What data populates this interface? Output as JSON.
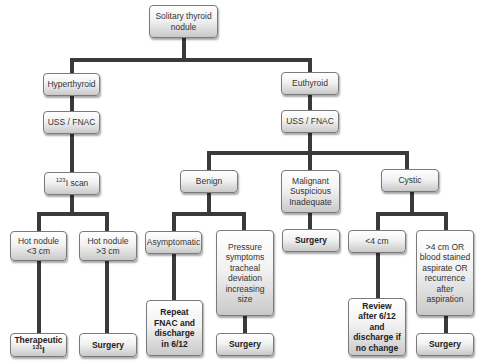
{
  "diagram": {
    "colors": {
      "connector": "#3a3a3a",
      "box_border": "#7a7a7a",
      "box_fill_top": "#ffffff",
      "box_fill_bottom": "#c9c9c9",
      "text": "#333333"
    },
    "nodes": {
      "root": "Solitary thyroid nodule",
      "hyperthyroid": "Hyperthyroid",
      "hyper_uss": "USS / FNAC",
      "iscan_sup": "123",
      "iscan": "I scan",
      "hot_small": "Hot nodule <3 cm",
      "hot_large": "Hot nodule >3 cm",
      "therapeutic": "Therapeutic ",
      "therapeutic_sup": "131",
      "therapeutic_suffix": "I",
      "surgery_hot": "Surgery",
      "euthyroid": "Euthyroid",
      "eu_uss": "USS / FNAC",
      "benign": "Benign",
      "malignant": "Malignant Suspicious Inadequate",
      "cystic": "Cystic",
      "asymptomatic": "Asymptomatic",
      "pressure": "Pressure symptoms tracheal deviation increasing size",
      "repeat_fnac": "Repeat FNAC and discharge in 6/12",
      "surgery_pressure": "Surgery",
      "surgery_malignant": "Surgery",
      "small_cyst": "<4 cm",
      "large_cyst": ">4 cm OR blood stained aspirate OR recurrence after aspiration",
      "review": "Review after 6/12 and discharge if no change",
      "surgery_cyst": "Surgery"
    }
  }
}
